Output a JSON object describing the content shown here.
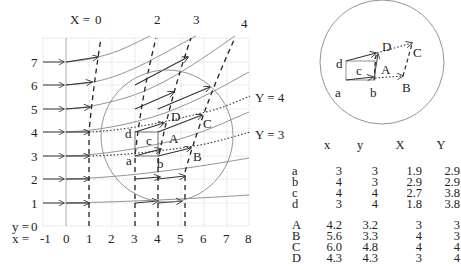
{
  "left_plot": {
    "top_label_prefix": "X =",
    "X_labels": [
      "0",
      "2",
      "3",
      "4"
    ],
    "y_ticks": [
      "7",
      "6",
      "5",
      "4",
      "3",
      "2",
      "1",
      "0"
    ],
    "y_axis_label": "y =",
    "x_axis_label": "x =",
    "x_ticks": [
      "-1",
      "0",
      "1",
      "2",
      "3",
      "4",
      "5",
      "6",
      "7",
      "8"
    ],
    "Y_curve_labels": [
      "Y = 4",
      "Y = 3"
    ],
    "point_labels": {
      "a": "a",
      "b": "b",
      "c": "c",
      "d": "d",
      "A": "A",
      "B": "B",
      "C": "C",
      "D": "D"
    }
  },
  "inset": {
    "point_labels": {
      "a": "a",
      "b": "b",
      "c": "c",
      "d": "d",
      "A": "A",
      "B": "B",
      "C": "C",
      "D": "D"
    }
  },
  "table": {
    "headers": [
      "",
      "x",
      "y",
      "X",
      "Y"
    ],
    "group1": [
      {
        "name": "a",
        "x": "3",
        "y": "3",
        "X": "1.9",
        "Y": "2.9"
      },
      {
        "name": "b",
        "x": "4",
        "y": "3",
        "X": "2.9",
        "Y": "2.9"
      },
      {
        "name": "c",
        "x": "4",
        "y": "4",
        "X": "2.7",
        "Y": "3.8"
      },
      {
        "name": "d",
        "x": "3",
        "y": "4",
        "X": "1.8",
        "Y": "3.8"
      }
    ],
    "group2": [
      {
        "name": "A",
        "x": "4.2",
        "y": "3.2",
        "X": "3",
        "Y": "3"
      },
      {
        "name": "B",
        "x": "5.6",
        "y": "3.3",
        "X": "4",
        "Y": "3"
      },
      {
        "name": "C",
        "x": "6.0",
        "y": "4.8",
        "X": "4",
        "Y": "4"
      },
      {
        "name": "D",
        "x": "4.3",
        "y": "4.3",
        "X": "3",
        "Y": "4"
      }
    ]
  },
  "colors": {
    "grid": "#cfcfcf",
    "line": "#333333",
    "curve": "#888888",
    "circle": "#888888"
  }
}
